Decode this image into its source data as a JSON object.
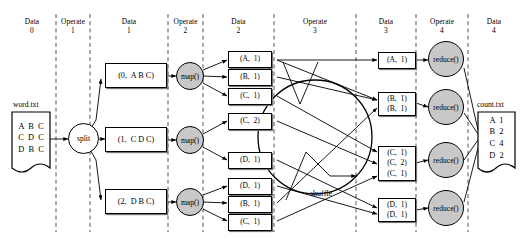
{
  "diagram": {
    "columns": [
      {
        "kind": "Data",
        "index": "0"
      },
      {
        "kind": "Operate",
        "index": "1"
      },
      {
        "kind": "Data",
        "index": "1"
      },
      {
        "kind": "Operate",
        "index": "2"
      },
      {
        "kind": "Data",
        "index": "2"
      },
      {
        "kind": "Operate",
        "index": "3"
      },
      {
        "kind": "Data",
        "index": "3"
      },
      {
        "kind": "Operate",
        "index": "4"
      },
      {
        "kind": "Data",
        "index": "4"
      }
    ],
    "input_file": {
      "name": "word.txt",
      "lines": [
        "A  B  C",
        "C  D  C",
        "D  B  C"
      ]
    },
    "output_file": {
      "name": "count.txt",
      "lines": [
        "A  1",
        "B  2",
        "C  4",
        "D  2"
      ]
    },
    "split_operator": {
      "label": "split"
    },
    "map_operators": [
      {
        "label": "map()"
      },
      {
        "label": "map()"
      },
      {
        "label": "map()"
      }
    ],
    "reduce_operators": [
      {
        "label": "reduce()"
      },
      {
        "label": "reduce()"
      },
      {
        "label": "reduce()"
      },
      {
        "label": "reduce()"
      }
    ],
    "shuffle_operator": {
      "label": "shuffle"
    },
    "data1_records": [
      {
        "text": "(0,  A B C)"
      },
      {
        "text": "(1,  C D C)"
      },
      {
        "text": "(2,  D B C)"
      }
    ],
    "data2_pairs": [
      {
        "rows": [
          "(A,  1)"
        ]
      },
      {
        "rows": [
          "(B,  1)"
        ]
      },
      {
        "rows": [
          "(C,  1)"
        ]
      },
      {
        "rows": [
          "(C,  2)"
        ]
      },
      {
        "rows": [
          "(D,  1)"
        ]
      },
      {
        "rows": [
          "(D,  1)"
        ]
      },
      {
        "rows": [
          "(B,  1)"
        ]
      },
      {
        "rows": [
          "(C,  1)"
        ]
      }
    ],
    "data3_groups": [
      {
        "rows": [
          "(A,  1)"
        ]
      },
      {
        "rows": [
          "(B,  1)",
          "(B,  1)"
        ]
      },
      {
        "rows": [
          "(C,  1)",
          "(C,  2)",
          "(C,  1)"
        ]
      },
      {
        "rows": [
          "(D,  1)",
          "(D,  1)"
        ]
      }
    ],
    "colors": {
      "operator_fill": "#c8c8c8",
      "stroke": "#000000",
      "divider": "#555555",
      "background": "#ffffff"
    }
  }
}
